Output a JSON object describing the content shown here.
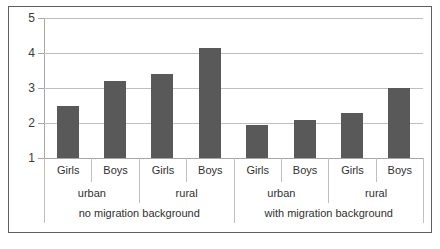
{
  "chart_data": {
    "type": "bar",
    "title": "",
    "xlabel": "",
    "ylabel": "",
    "ylim": [
      1,
      5
    ],
    "yticks": [
      1,
      2,
      3,
      4,
      5
    ],
    "grid": true,
    "legend": null,
    "bar_color": "#595959",
    "categories": [
      "Girls / urban / no migration background",
      "Boys / urban / no migration background",
      "Girls / rural / no migration background",
      "Boys / rural / no migration background",
      "Girls / urban / with migration background",
      "Boys / urban / with migration background",
      "Girls / rural / with migration background",
      "Boys / rural / with migration background"
    ],
    "values": [
      2.5,
      3.2,
      3.4,
      4.15,
      1.95,
      2.1,
      2.3,
      3.0
    ],
    "axis_levels": {
      "level1": [
        "Girls",
        "Boys",
        "Girls",
        "Boys",
        "Girls",
        "Boys",
        "Girls",
        "Boys"
      ],
      "level2": [
        "urban",
        "rural",
        "urban",
        "rural"
      ],
      "level3": [
        "no migration background",
        "with migration background"
      ]
    }
  },
  "y_axis": {
    "ticks": [
      {
        "label": "5",
        "value": 5
      },
      {
        "label": "4",
        "value": 4
      },
      {
        "label": "3",
        "value": 3
      },
      {
        "label": "2",
        "value": 2
      },
      {
        "label": "1",
        "value": 1
      }
    ]
  }
}
